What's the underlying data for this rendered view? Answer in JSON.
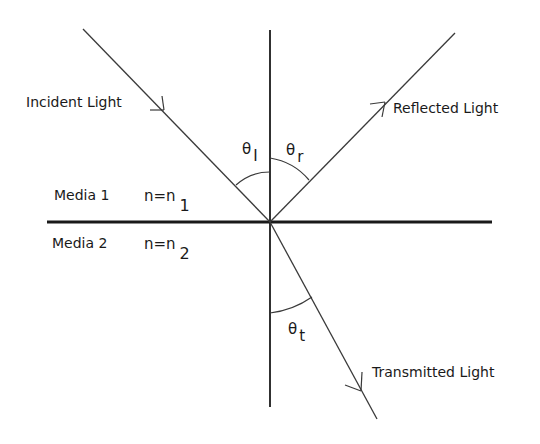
{
  "diagram": {
    "labels": {
      "incident": "Incident Light",
      "reflected": "Reflected Light",
      "transmitted": "Transmitted Light",
      "media1": "Media 1",
      "media2": "Media 2",
      "n1_prefix": "n=n",
      "n1_sub": "1",
      "n2_prefix": "n=n",
      "n2_sub": "2"
    },
    "angles": {
      "incidence": {
        "symbol": "θ",
        "sub": "I"
      },
      "reflection": {
        "symbol": "θ",
        "sub": "r"
      },
      "transmission": {
        "symbol": "θ",
        "sub": "t"
      }
    },
    "colors": {
      "line": "#3a3a3a",
      "interface": "#1a1a1a",
      "text": "#1a1a1a",
      "background": "#ffffff"
    }
  }
}
